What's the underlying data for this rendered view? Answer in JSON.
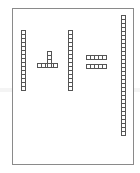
{
  "figure": {
    "left_rod": {
      "cells": 15
    },
    "plus_sign": {
      "horizontal_cells": 5,
      "vertical_cells": 4
    },
    "middle_rod": {
      "cells": 15
    },
    "equals_sign": {
      "rows": 2,
      "cells_per_row": 5
    },
    "right_rod": {
      "cells": 30
    }
  },
  "colors": {
    "line": "#555555",
    "frame": "#8a8a8a",
    "background": "#ffffff"
  }
}
